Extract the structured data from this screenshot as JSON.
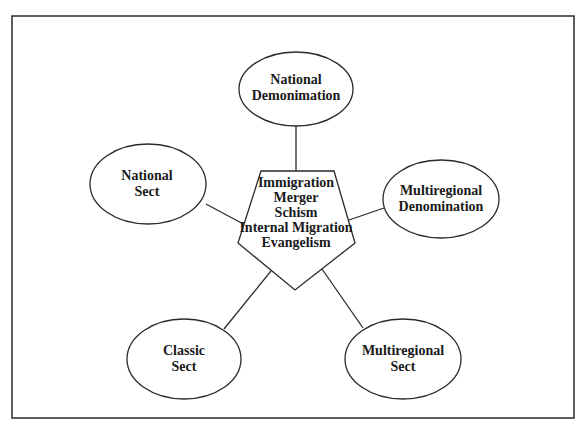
{
  "diagram": {
    "center": {
      "shape": "pentagon",
      "lines": [
        "Immigration",
        "Merger",
        "Schism",
        "Internal Migration",
        "Evangelism"
      ]
    },
    "nodes": [
      {
        "id": "national-denomination",
        "lines": [
          "National",
          "Demonimation"
        ]
      },
      {
        "id": "national-sect",
        "lines": [
          "National",
          "Sect"
        ]
      },
      {
        "id": "multiregional-denomination",
        "lines": [
          "Multiregional",
          "Denomination"
        ]
      },
      {
        "id": "classic-sect",
        "lines": [
          "Classic",
          "Sect"
        ]
      },
      {
        "id": "multiregional-sect",
        "lines": [
          "Multiregional",
          "Sect"
        ]
      }
    ],
    "colors": {
      "stroke": "#2a2a2a",
      "background": "#ffffff",
      "text": "#1a1a1a"
    }
  }
}
